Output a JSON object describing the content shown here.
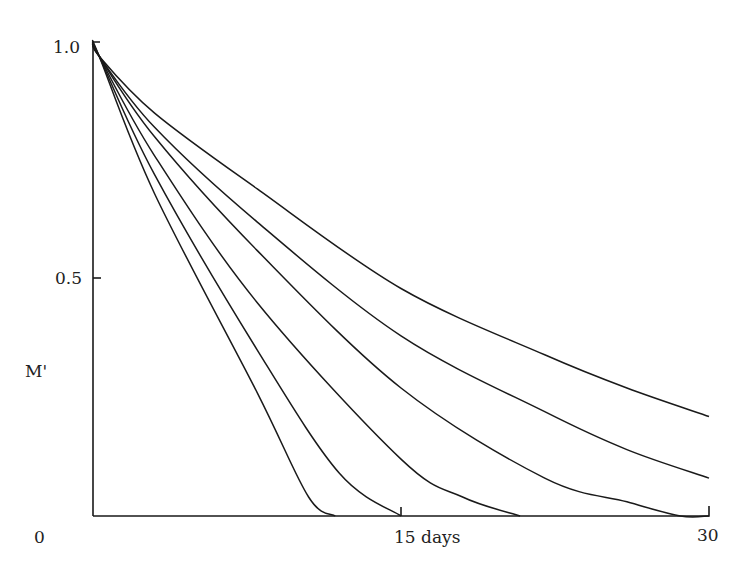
{
  "chart_data": {
    "type": "line",
    "title": "",
    "xlabel": "days",
    "ylabel": "M'",
    "xlim": [
      0,
      30
    ],
    "ylim": [
      0,
      1.0
    ],
    "x_ticks": [
      {
        "value": 0,
        "label": "0"
      },
      {
        "value": 15,
        "label": "15 days"
      },
      {
        "value": 30,
        "label": "30"
      }
    ],
    "y_ticks": [
      {
        "value": 0.5,
        "label": "0.5"
      },
      {
        "value": 1.0,
        "label": "1.0"
      }
    ],
    "grid": false,
    "legend": null,
    "series": [
      {
        "name": "curve-1",
        "x": [
          0,
          0.3,
          3,
          8,
          15,
          22,
          26,
          30
        ],
        "values": [
          1.0,
          0.97,
          0.85,
          0.69,
          0.48,
          0.34,
          0.27,
          0.21
        ]
      },
      {
        "name": "curve-2",
        "x": [
          0,
          0.3,
          3,
          8,
          15,
          22,
          26,
          30
        ],
        "values": [
          1.0,
          0.97,
          0.82,
          0.62,
          0.38,
          0.22,
          0.14,
          0.08
        ]
      },
      {
        "name": "curve-3",
        "x": [
          0,
          0.3,
          3,
          8,
          15,
          22,
          26,
          28.6,
          30
        ],
        "values": [
          1.0,
          0.97,
          0.8,
          0.56,
          0.27,
          0.08,
          0.03,
          0.0,
          0.0
        ]
      },
      {
        "name": "curve-4",
        "x": [
          0,
          0.3,
          3,
          8,
          15,
          18,
          20.8
        ],
        "values": [
          1.0,
          0.97,
          0.76,
          0.45,
          0.12,
          0.04,
          0.0
        ]
      },
      {
        "name": "curve-5",
        "x": [
          0,
          0.3,
          3,
          8,
          12,
          15
        ],
        "values": [
          1.0,
          0.97,
          0.72,
          0.35,
          0.09,
          0.0
        ]
      },
      {
        "name": "curve-6",
        "x": [
          0,
          0.3,
          3,
          8,
          10.5,
          11.8
        ],
        "values": [
          1.0,
          0.97,
          0.68,
          0.26,
          0.04,
          0.0
        ]
      }
    ]
  },
  "labels": {
    "y_axis_label": "M'",
    "y_tick_top": "1.0",
    "y_tick_mid": "0.5",
    "x_tick_origin": "0",
    "x_tick_mid": "15 days",
    "x_tick_end": "30"
  }
}
